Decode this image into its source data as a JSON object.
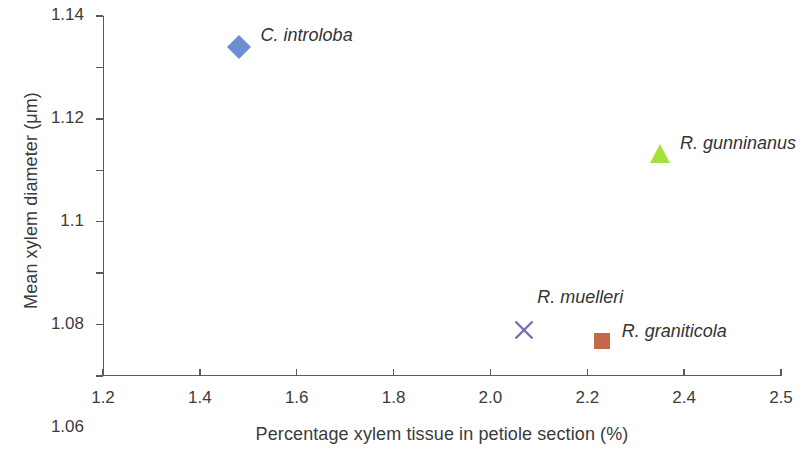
{
  "chart_data": {
    "type": "scatter",
    "title": "",
    "xlabel": "Percentage xylem tissue in petiole section (%)",
    "ylabel": "Mean xylem diameter (μm)",
    "xlim": [
      1.2,
      2.5
    ],
    "ylim": [
      1.0,
      1.14
    ],
    "grid": false,
    "legend": "inline-labels",
    "xticks": [
      "1.2",
      "1.4",
      "1.6",
      "1.8",
      "2.0",
      "2.2",
      "2.4",
      "2.5"
    ],
    "xtick_values": [
      1.2,
      1.4,
      1.6,
      1.8,
      2.0,
      2.2,
      2.4,
      2.5
    ],
    "yticks": [
      "1.0",
      "1.02",
      "1.04",
      "1.06",
      "1.08",
      "1.1",
      "1.12",
      "1.14"
    ],
    "ytick_values": [
      1.0,
      1.02,
      1.04,
      1.06,
      1.08,
      1.1,
      1.12,
      1.14
    ],
    "points": [
      {
        "label": "C. introloba",
        "x": 1.48,
        "y": 1.128,
        "marker": "diamond",
        "color": "#6b8fd4",
        "label_dx": 22,
        "label_dy": -22
      },
      {
        "label": "R. gunninanus",
        "x": 2.35,
        "y": 1.086,
        "marker": "triangle",
        "color": "#a5e03c",
        "label_dx": 20,
        "label_dy": -22
      },
      {
        "label": "R. muelleri",
        "x": 2.07,
        "y": 1.018,
        "marker": "cross",
        "color": "#7a6eb0",
        "label_dx": 13,
        "label_dy": -43
      },
      {
        "label": "R. graniticola",
        "x": 2.23,
        "y": 1.0135,
        "marker": "square",
        "color": "#c4684a",
        "label_dx": 20,
        "label_dy": -20
      }
    ]
  }
}
